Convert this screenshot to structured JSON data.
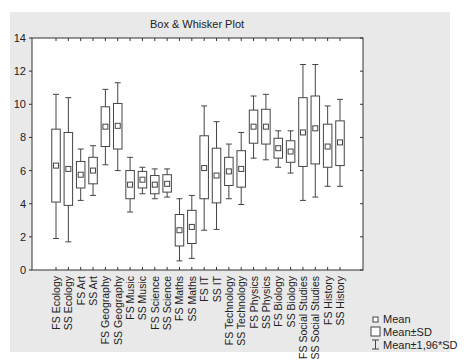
{
  "chart_data": {
    "type": "box",
    "title": "Box & Whisker Plot",
    "xlabel": "",
    "ylabel": "",
    "ylim": [
      0,
      14
    ],
    "yticks": [
      0,
      2,
      4,
      6,
      8,
      10,
      12,
      14
    ],
    "grid": false,
    "legend_position": "bottom-right",
    "legend": [
      {
        "symbol": "small-square",
        "label": "Mean"
      },
      {
        "symbol": "box",
        "label": "Mean±SD"
      },
      {
        "symbol": "whisker",
        "label": "Mean±1,96*SD"
      }
    ],
    "categories": [
      "FS Ecology",
      "SS Ecology",
      "FS Art",
      "SS Art",
      "FS Geography",
      "SS Geography",
      "FS Music",
      "SS Music",
      "FS Science",
      "SS Science",
      "FS Maths",
      "SS Maths",
      "FS IT",
      "SS IT",
      "FS Technology",
      "SS Technology",
      "FS Physics",
      "SS Physics",
      "FS Biology",
      "SS Biology",
      "FS Social Studies",
      "SS Social Studies",
      "FS History",
      "SS History"
    ],
    "series": [
      {
        "name": "Mean",
        "values": [
          6.3,
          6.1,
          5.75,
          6.0,
          8.65,
          8.7,
          5.15,
          5.45,
          5.15,
          5.2,
          2.4,
          2.6,
          6.15,
          5.7,
          5.95,
          6.1,
          8.65,
          8.65,
          7.35,
          7.15,
          8.3,
          8.55,
          7.45,
          7.7
        ]
      },
      {
        "name": "Mean-SD",
        "values": [
          4.1,
          3.9,
          4.95,
          5.2,
          7.45,
          7.3,
          4.3,
          4.95,
          4.6,
          4.7,
          1.45,
          1.6,
          4.3,
          4.05,
          5.1,
          5.0,
          7.65,
          7.6,
          6.75,
          6.5,
          6.25,
          6.4,
          6.2,
          6.3
        ]
      },
      {
        "name": "Mean+SD",
        "values": [
          8.5,
          8.3,
          6.55,
          6.8,
          9.85,
          10.05,
          6.0,
          5.95,
          5.7,
          5.75,
          3.35,
          3.6,
          8.1,
          7.35,
          6.8,
          7.2,
          9.65,
          9.7,
          7.95,
          7.8,
          10.4,
          10.5,
          8.8,
          9.0
        ]
      },
      {
        "name": "Mean-1,96*SD",
        "values": [
          1.9,
          1.7,
          4.2,
          4.5,
          6.35,
          6.0,
          3.5,
          4.6,
          4.3,
          4.4,
          0.55,
          0.7,
          2.4,
          2.45,
          4.3,
          3.95,
          6.75,
          6.65,
          6.2,
          5.85,
          4.2,
          4.4,
          5.05,
          5.05
        ]
      },
      {
        "name": "Mean+1,96*SD",
        "values": [
          10.6,
          10.4,
          7.3,
          7.5,
          10.9,
          11.3,
          6.8,
          6.2,
          6.1,
          6.1,
          4.3,
          4.5,
          9.9,
          8.95,
          7.6,
          8.3,
          10.5,
          10.6,
          8.4,
          8.4,
          12.4,
          12.4,
          9.9,
          10.3
        ]
      }
    ]
  }
}
